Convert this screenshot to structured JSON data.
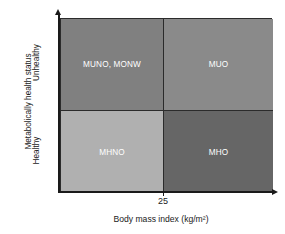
{
  "chart_data": {
    "type": "heatmap",
    "title": "",
    "subtitle": "",
    "xlabel": "Body mass index (kg/m²)",
    "ylabel": "Metabolically health status",
    "x_tick_labels": [
      "25"
    ],
    "x_categories": [
      "< 25",
      "≥ 25"
    ],
    "y_categories": [
      "Healthy",
      "Unhealthy"
    ],
    "y_tick_labels": [
      "Unhealthy",
      "Healthy"
    ],
    "grid": false,
    "legend": "none",
    "axis_arrows": true,
    "cells": [
      {
        "id": "munw",
        "label": "MUNO, MONW",
        "x_category": "< 25",
        "y_category": "Unhealthy",
        "position": "top-left",
        "color": "#808080"
      },
      {
        "id": "muo",
        "label": "MUO",
        "x_category": "≥ 25",
        "y_category": "Unhealthy",
        "position": "top-right",
        "color": "#8a8a8a"
      },
      {
        "id": "mhno",
        "label": "MHNO",
        "x_category": "< 25",
        "y_category": "Healthy",
        "position": "bottom-left",
        "color": "#b0b0b0"
      },
      {
        "id": "mho",
        "label": "MHO",
        "x_category": "≥ 25",
        "y_category": "Healthy",
        "position": "bottom-right",
        "color": "#666666"
      }
    ],
    "colors": {
      "axis": "#1a1a1a",
      "border": "#2b2b2b",
      "label_text": "#ffffff",
      "background": "#ffffff"
    }
  }
}
